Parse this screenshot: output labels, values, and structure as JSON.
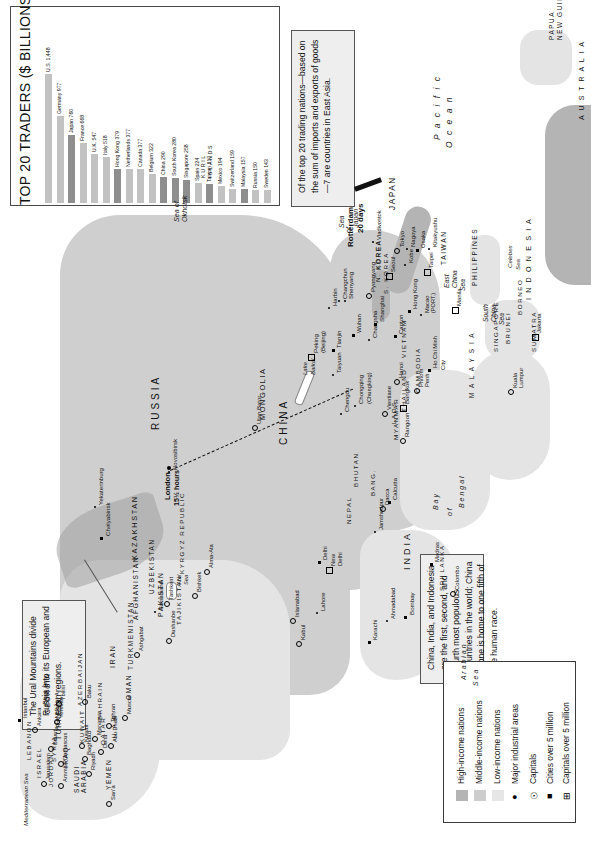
{
  "chart": {
    "title_cap": "T",
    "title_rest": "OP 20 ",
    "title_cap2": "T",
    "title_rest2": "RADERS ($ ",
    "title_sc": "BILLIONS)",
    "title_full": "TOP 20 TRADERS ($ BILLIONS)",
    "ylabel": "",
    "xlabel": ""
  },
  "chart_data": {
    "type": "bar",
    "title": "TOP 20 TRADERS ($ BILLIONS)",
    "xlabel": "",
    "ylabel": "$ Billions",
    "ylim": [
      0,
      1500
    ],
    "grid": false,
    "legend": "none",
    "categories": [
      "U.S.",
      "Germany",
      "Japan",
      "France",
      "U.K.",
      "Italy",
      "Hong Kong",
      "Netherlands",
      "Canada",
      "Belgium",
      "China",
      "South Korea",
      "Singapore",
      "Spain",
      "Taiwan",
      "Mexico",
      "Switzerland",
      "Malaysia",
      "Russia",
      "Sweden"
    ],
    "values": [
      1448,
      977,
      760,
      668,
      547,
      518,
      379,
      377,
      377,
      322,
      290,
      280,
      258,
      224,
      217,
      194,
      159,
      157,
      150,
      143
    ],
    "labels": [
      "U.S. 1,448",
      "Germany 977",
      "Japan 760",
      "France 668",
      "U.K. 547",
      "Italy 518",
      "Hong Kong 379",
      "Netherlands 377",
      "Canada 377",
      "Belgium 322",
      "China 290",
      "South Korea 280",
      "Singapore 258",
      "Spain 224",
      "Taiwan 217",
      "Mexico 194",
      "Switzerland 159",
      "Malaysia 157",
      "Russia 150",
      "Sweden 143"
    ],
    "highlight": [
      false,
      false,
      true,
      false,
      false,
      false,
      true,
      false,
      false,
      false,
      true,
      true,
      true,
      false,
      true,
      false,
      false,
      true,
      false,
      false
    ],
    "highlight_meaning": "East Asian trading nations shown in darker gray"
  },
  "callouts": {
    "east_asia": "Of the top 20 trading nations—based on the sum of imports and exports of goods—7 are countries in East Asia.",
    "urals": "The Ural Mountains divide Russia into its European and Asian regions.",
    "population": "China, India, and Indonesia are the first, second, and fourth most populous countries in the world; China alone is home to one fifth of the human race."
  },
  "legend": {
    "items": [
      {
        "label": "High-income nations",
        "symbol": "swatch",
        "color": "#b4b4b4"
      },
      {
        "label": "Middle-income nations",
        "symbol": "swatch",
        "color": "#cdcdcd"
      },
      {
        "label": "Low-income nations",
        "symbol": "swatch",
        "color": "#e6e6e6"
      },
      {
        "label": "Major industrial areas",
        "symbol": "dot",
        "color": "#000000"
      },
      {
        "label": "Capitals",
        "symbol": "circled-star",
        "color": "#000000"
      },
      {
        "label": "Cities over 5 million",
        "symbol": "filled-square",
        "color": "#000000"
      },
      {
        "label": "Capitals over 5 million",
        "symbol": "boxed-star",
        "color": "#000000"
      }
    ]
  },
  "route": {
    "origin": "London",
    "origin_time": "15½ hours",
    "destination": "Rotterdam",
    "destination_time": "20 days",
    "via": "Novosibirsk"
  },
  "map": {
    "countries": [
      {
        "name": "RUSSIA"
      },
      {
        "name": "CHINA"
      },
      {
        "name": "INDIA"
      },
      {
        "name": "MONGOLIA"
      },
      {
        "name": "KAZAKHSTAN"
      },
      {
        "name": "IRAN"
      },
      {
        "name": "TURKEY"
      },
      {
        "name": "PAKISTAN"
      },
      {
        "name": "AFGHANISTAN"
      },
      {
        "name": "SAUDI ARABIA"
      },
      {
        "name": "YEMEN"
      },
      {
        "name": "OMAN"
      },
      {
        "name": "IRAQ"
      },
      {
        "name": "SYRIA"
      },
      {
        "name": "ISRAEL"
      },
      {
        "name": "JORDAN"
      },
      {
        "name": "LEBANON"
      },
      {
        "name": "KUWAIT"
      },
      {
        "name": "BAHRAIN"
      },
      {
        "name": "QATAR"
      },
      {
        "name": "U.A.E."
      },
      {
        "name": "GEORGIA"
      },
      {
        "name": "ARMENIA"
      },
      {
        "name": "AZERBAIJAN"
      },
      {
        "name": "TURKMENISTAN"
      },
      {
        "name": "UZBEKISTAN"
      },
      {
        "name": "TAJIKISTAN"
      },
      {
        "name": "KYRGYZ REPUBLIC"
      },
      {
        "name": "NEPAL"
      },
      {
        "name": "BHUTAN"
      },
      {
        "name": "BANG."
      },
      {
        "name": "SRI LANKA"
      },
      {
        "name": "MYANMAR"
      },
      {
        "name": "THAILAND"
      },
      {
        "name": "LAOS"
      },
      {
        "name": "CAMBODIA"
      },
      {
        "name": "VIETNAM"
      },
      {
        "name": "MALAYSIA"
      },
      {
        "name": "SINGAPORE"
      },
      {
        "name": "INDONESIA"
      },
      {
        "name": "BRUNEI"
      },
      {
        "name": "PHILIPPINES"
      },
      {
        "name": "JAPAN"
      },
      {
        "name": "N. KOREA"
      },
      {
        "name": "S. KOREA"
      },
      {
        "name": "TAIWAN"
      },
      {
        "name": "PAPUA NEW GUINEA"
      },
      {
        "name": "AUSTRALIA"
      },
      {
        "name": "SUMATRA"
      },
      {
        "name": "BORNEO"
      },
      {
        "name": "KURIL ISLANDS"
      }
    ],
    "cities": [
      "Tokyo",
      "Nagoya",
      "Osaka",
      "Kitakyushu",
      "Kobe",
      "Seoul",
      "Pyongyang",
      "Shenyang",
      "Changchun",
      "Harbin",
      "Peking (Beijing)",
      "Tianjin",
      "Taiyuan",
      "Wuhan",
      "Shanghai",
      "Changsha",
      "Canton",
      "Hong Kong",
      "Macao (Port.)",
      "Taipei",
      "Chengdu",
      "Chongqing (Chungking)",
      "Hanoi",
      "Bangkok",
      "Rangoon",
      "Ho Chi Minh City",
      "Phnom Penh",
      "Vientiane",
      "Manila",
      "Jakarta",
      "Kuala Lumpur",
      "Calcutta",
      "Dacca",
      "Jamshedpur",
      "New Delhi",
      "Delhi",
      "Bombay",
      "Ahmadabad",
      "Madras",
      "Colombo",
      "Karachi",
      "Lahore",
      "Islamabad",
      "Kabul",
      "Tehran",
      "Baghdad",
      "Damascus",
      "Amman",
      "Jerusalem",
      "Beirut",
      "Ankara",
      "Istanbul",
      "Tbilisi",
      "Yerevan",
      "Baku",
      "Ashgabat",
      "Tashkent",
      "Bishkek",
      "Alma-Ata",
      "Dushanbe",
      "Samarkand",
      "Novosibirsk",
      "Chelyabinsk",
      "Yekaterinburg",
      "Ulan Bator",
      "Vladivostok",
      "Kuwait",
      "Manama",
      "Doha",
      "Abu Dhabi",
      "Riyadh",
      "Muscat",
      "San'a"
    ],
    "waters": [
      "Pacific Ocean",
      "Sea of Okhotsk",
      "Sea of Japan",
      "East China Sea",
      "South China Sea",
      "Bay of Bengal",
      "Arabian Sea",
      "Black Sea",
      "Mediterranean Sea",
      "Celebes Sea",
      "Aral Sea",
      "Lake Baikal"
    ]
  }
}
